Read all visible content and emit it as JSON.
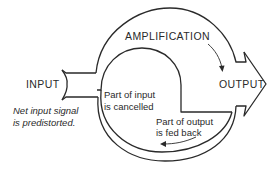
{
  "diagram": {
    "type": "feedback-amplifier-flow",
    "labels": {
      "input": "INPUT",
      "amplification": "AMPLIFICATION",
      "output": "OUTPUT",
      "cancelled_line1": "Part of input",
      "cancelled_line2": "is cancelled",
      "fedback_line1": "Part of output",
      "fedback_line2": "is fed back",
      "note_line1": "Net input signal",
      "note_line2": "is predistorted."
    },
    "colors": {
      "line": "#2a2a2a",
      "background": "#ffffff"
    }
  }
}
